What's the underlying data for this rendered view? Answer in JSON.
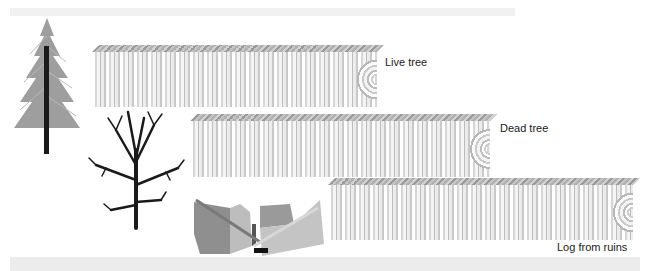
{
  "figure": {
    "labels": {
      "live_tree": "Live tree",
      "dead_tree": "Dead tree",
      "log_from_ruins": "Log from ruins"
    },
    "colors": {
      "log_light": "#f4f4f4",
      "log_dark": "#bdbdbd",
      "tree_trunk": "#1a1a1a",
      "ruins_wall": "#9c9c9c",
      "caption_band": "#ececec"
    }
  }
}
